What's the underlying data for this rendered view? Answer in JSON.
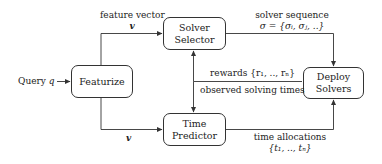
{
  "nodes": {
    "featurize": {
      "label": "Featurize"
    },
    "solver_selector": {
      "line1": "Solver",
      "line2": "Selector"
    },
    "time_predictor": {
      "line1": "Time",
      "line2": "Predictor"
    },
    "deploy_solvers": {
      "line1": "Deploy",
      "line2": "Solvers"
    }
  },
  "input": {
    "label": "Query",
    "symbol": "q"
  },
  "edges": {
    "feature_vector_top": {
      "label": "feature vector",
      "symbol": "v"
    },
    "feature_vector_bottom": {
      "symbol": "v"
    },
    "solver_sequence": {
      "label": "solver sequence",
      "formula": "σ = {σᵢ, σⱼ, ..}"
    },
    "rewards": {
      "label": "rewards {r₁, .., rₙ}"
    },
    "observed": {
      "label": "observed solving times"
    },
    "time_allocations": {
      "label": "time allocations",
      "formula": "{t₁, .., tₙ}"
    }
  },
  "colors": {
    "stroke": "#333333",
    "text": "#222222",
    "background": "#ffffff"
  }
}
